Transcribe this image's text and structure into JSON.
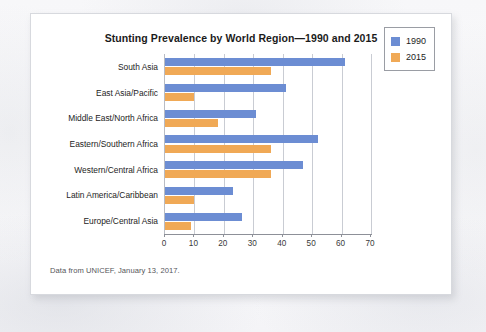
{
  "figure": {
    "title": "Stunting Prevalence by World Region—1990 and 2015",
    "source_note": "Data from UNICEF, January 13, 2017."
  },
  "legend": {
    "position": "top-right",
    "items": [
      {
        "label": "1990",
        "color": "#6c8dd3"
      },
      {
        "label": "2015",
        "color": "#f0a956"
      }
    ]
  },
  "axis": {
    "ticks": [
      "0",
      "10",
      "20",
      "30",
      "40",
      "50",
      "60",
      "70"
    ]
  },
  "chart_data": {
    "type": "bar",
    "orientation": "horizontal",
    "title": "Stunting Prevalence by World Region—1990 and 2015",
    "xlabel": "",
    "ylabel": "",
    "xlim": [
      0,
      70
    ],
    "xticks": [
      0,
      10,
      20,
      30,
      40,
      50,
      60,
      70
    ],
    "grid": true,
    "legend_position": "top-right",
    "categories": [
      "South Asia",
      "East Asia/Pacific",
      "Middle East/North Africa",
      "Eastern/Southern Africa",
      "Western/Central Africa",
      "Latin America/Caribbean",
      "Europe/Central Asia"
    ],
    "series": [
      {
        "name": "1990",
        "color": "#6c8dd3",
        "values": [
          61,
          41,
          31,
          52,
          47,
          23,
          26
        ]
      },
      {
        "name": "2015",
        "color": "#f0a956",
        "values": [
          36,
          10,
          18,
          36,
          36,
          10,
          9
        ]
      }
    ]
  }
}
